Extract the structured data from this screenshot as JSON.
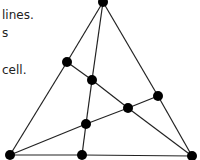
{
  "text_fragments": [
    {
      "text": "lines.",
      "y": 8
    },
    {
      "text": "s",
      "y": 26
    },
    {
      "text": "cell.",
      "y": 63
    }
  ],
  "graph": {
    "nodes": [
      {
        "id": "top",
        "x": 103,
        "y": 2
      },
      {
        "id": "left-mid",
        "x": 67,
        "y": 62
      },
      {
        "id": "center-up",
        "x": 92,
        "y": 80
      },
      {
        "id": "right-mid",
        "x": 158,
        "y": 96
      },
      {
        "id": "center",
        "x": 128,
        "y": 108
      },
      {
        "id": "center-low",
        "x": 86,
        "y": 124
      },
      {
        "id": "bottom-left",
        "x": 10,
        "y": 155
      },
      {
        "id": "bottom-mid",
        "x": 82,
        "y": 155
      },
      {
        "id": "bottom-right",
        "x": 192,
        "y": 156
      }
    ],
    "edges": [
      [
        "top",
        "left-mid"
      ],
      [
        "left-mid",
        "bottom-left"
      ],
      [
        "top",
        "right-mid"
      ],
      [
        "right-mid",
        "bottom-right"
      ],
      [
        "top",
        "center-up"
      ],
      [
        "center-up",
        "center-low"
      ],
      [
        "center-low",
        "bottom-mid"
      ],
      [
        "left-mid",
        "center-up"
      ],
      [
        "center-up",
        "center"
      ],
      [
        "center",
        "bottom-right"
      ],
      [
        "bottom-left",
        "center-low"
      ],
      [
        "center-low",
        "center"
      ],
      [
        "center",
        "right-mid"
      ],
      [
        "bottom-left",
        "bottom-mid"
      ],
      [
        "bottom-mid",
        "bottom-right"
      ]
    ],
    "node_radius": 5,
    "node_color": "#000000",
    "edge_color": "#222222"
  }
}
